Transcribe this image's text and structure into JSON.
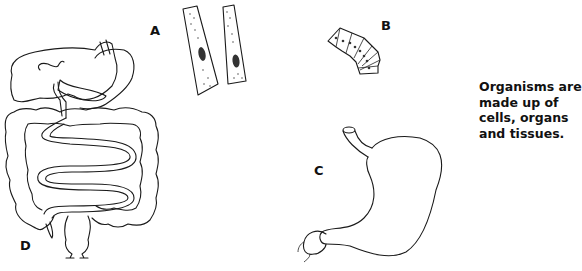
{
  "figure": {
    "labels": {
      "a": "A",
      "b": "B",
      "c": "C",
      "d": "D"
    },
    "parts": {
      "a": "muscle-cells",
      "b": "epithelial-tissue",
      "c": "stomach-organ",
      "d": "digestive-system"
    },
    "caption_lines": [
      "Organisms are",
      "made up of",
      "cells, organs",
      "and tissues."
    ],
    "colors": {
      "ink": "#1a1a1a",
      "background": "#ffffff",
      "nucleus": "#111111"
    }
  }
}
